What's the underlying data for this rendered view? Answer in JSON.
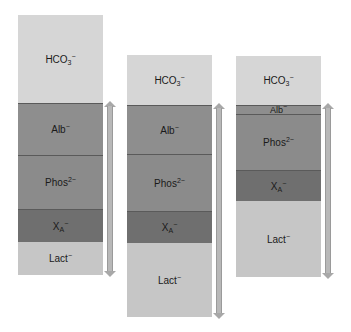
{
  "diagram": {
    "colors": {
      "HCO3": "#d6d6d6",
      "Alb": "#8e8e8e",
      "Phos": "#8b8b8b",
      "XA": "#6f6f6f",
      "Lact": "#c6c6c6",
      "arrow": "#b8b8b8"
    },
    "columns": [
      {
        "label": "column-1",
        "segments": [
          {
            "key": "HCO3",
            "base": "HCO",
            "sub": "3",
            "sup": "−",
            "top": 0,
            "height": 88
          },
          {
            "key": "Alb",
            "base": "Alb",
            "sub": "",
            "sup": "−",
            "top": 88,
            "height": 52
          },
          {
            "key": "Phos",
            "base": "Phos",
            "sub": "",
            "sup": "2−",
            "top": 140,
            "height": 54
          },
          {
            "key": "XA",
            "base": "X",
            "sub": "A",
            "sup": "−",
            "top": 194,
            "height": 33
          },
          {
            "key": "Lact",
            "base": "Lact",
            "sub": "",
            "sup": "−",
            "top": 227,
            "height": 33
          }
        ]
      },
      {
        "label": "column-2",
        "segments": [
          {
            "key": "HCO3",
            "base": "HCO",
            "sub": "3",
            "sup": "−",
            "top": 0,
            "height": 50
          },
          {
            "key": "Alb",
            "base": "Alb",
            "sub": "",
            "sup": "−",
            "top": 50,
            "height": 49
          },
          {
            "key": "Phos",
            "base": "Phos",
            "sub": "",
            "sup": "2−",
            "top": 99,
            "height": 57
          },
          {
            "key": "XA",
            "base": "X",
            "sub": "A",
            "sup": "−",
            "top": 156,
            "height": 32
          },
          {
            "key": "Lact",
            "base": "Lact",
            "sub": "",
            "sup": "−",
            "top": 188,
            "height": 74
          }
        ]
      },
      {
        "label": "column-3",
        "segments": [
          {
            "key": "HCO3",
            "base": "HCO",
            "sub": "3",
            "sup": "−",
            "top": 0,
            "height": 49
          },
          {
            "key": "Alb",
            "base": "Alb",
            "sub": "",
            "sup": "−",
            "top": 49,
            "height": 9
          },
          {
            "key": "Phos",
            "base": "Phos",
            "sub": "",
            "sup": "2−",
            "top": 58,
            "height": 56
          },
          {
            "key": "XA",
            "base": "X",
            "sub": "A",
            "sup": "−",
            "top": 114,
            "height": 31
          },
          {
            "key": "Lact",
            "base": "Lact",
            "sub": "",
            "sup": "−",
            "top": 145,
            "height": 76
          }
        ]
      }
    ]
  }
}
